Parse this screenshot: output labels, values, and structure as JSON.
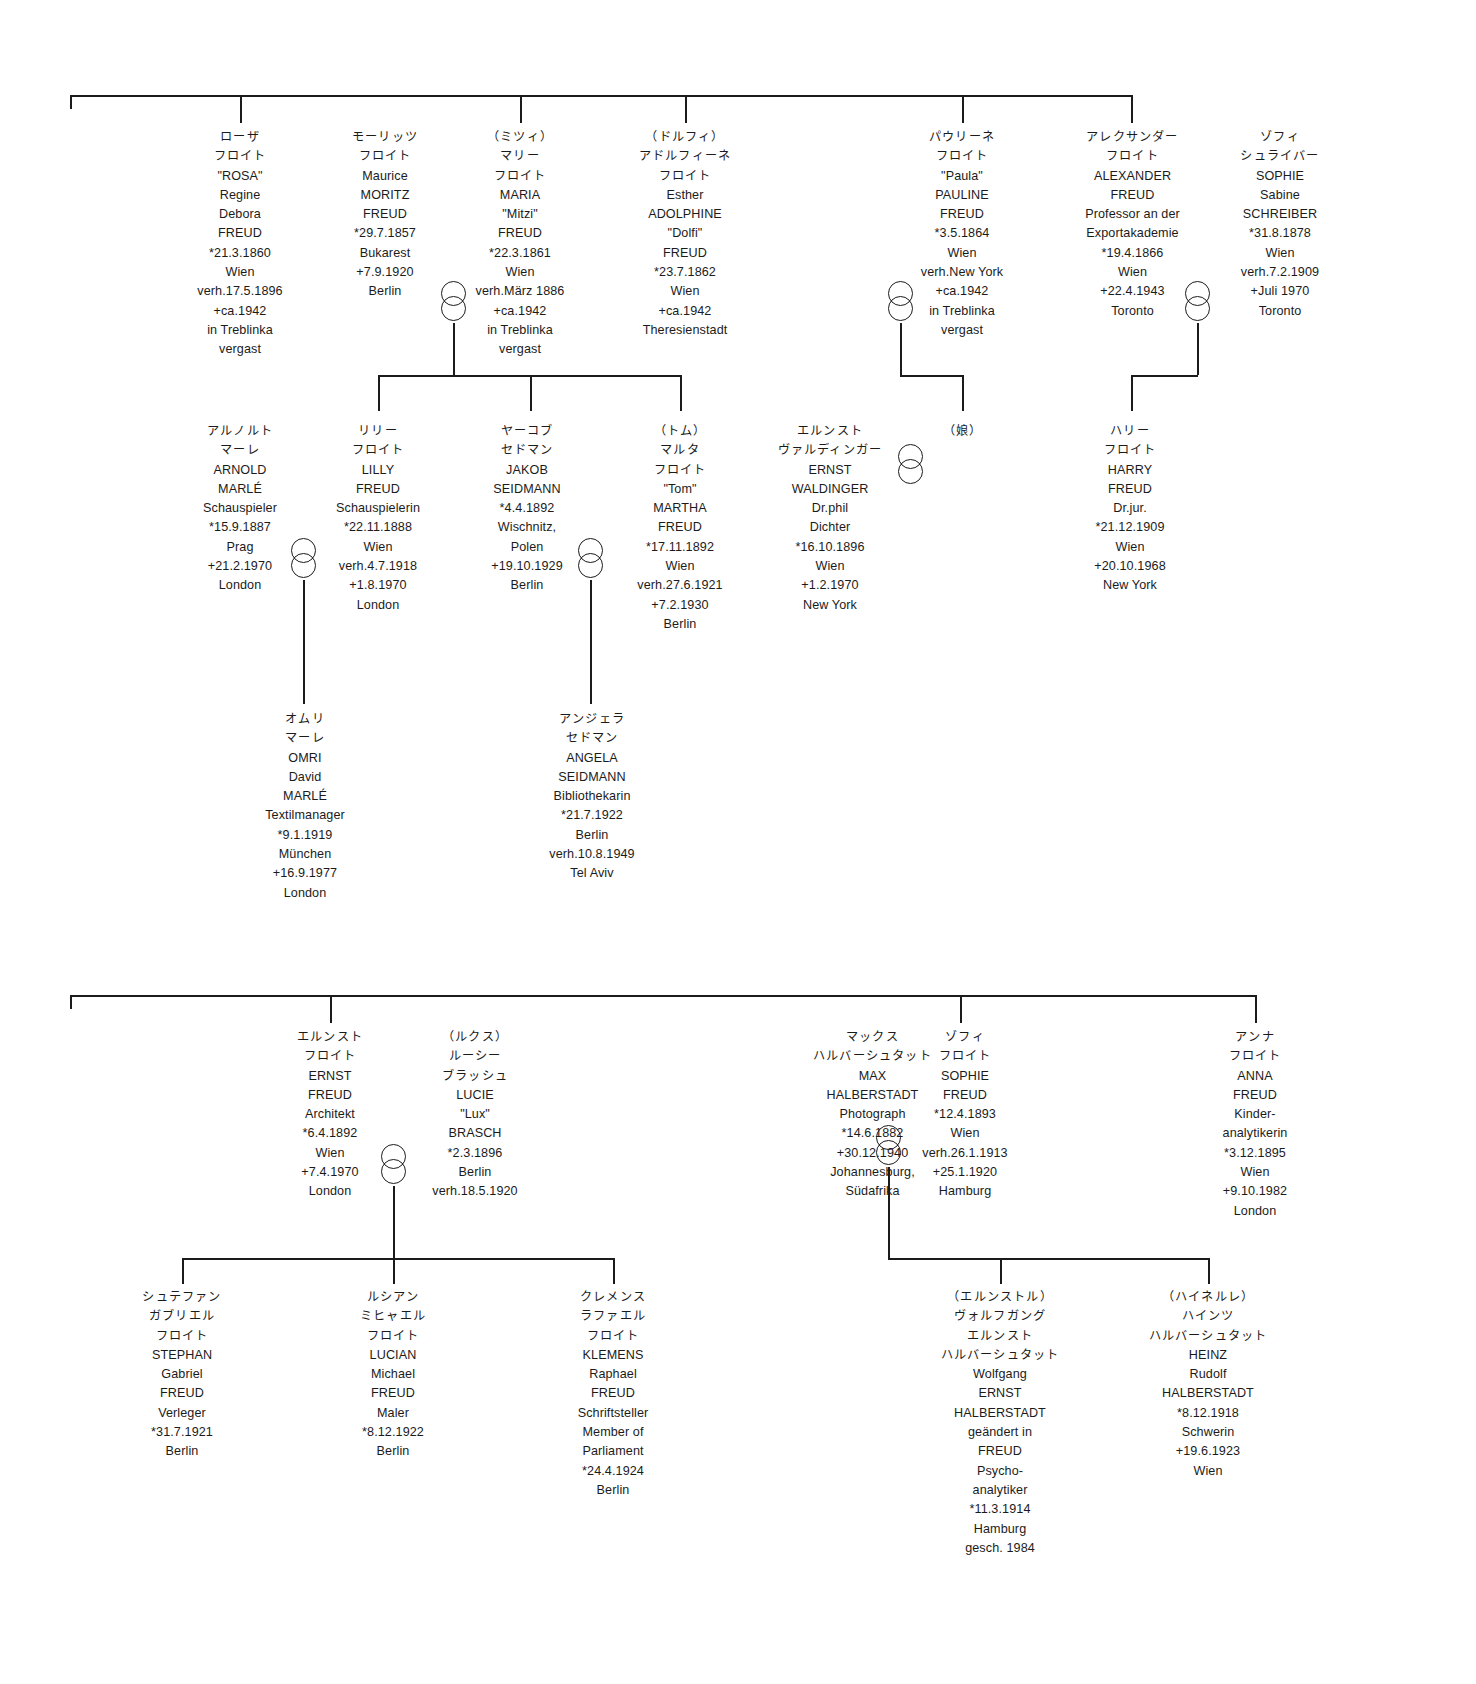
{
  "diagram": {
    "line_color": "#1b1b1b",
    "background": "#ffffff"
  },
  "people": [
    {
      "id": "rosa-freud",
      "name": "Rosa Freud",
      "lines": [
        "ローザ",
        "フロイト",
        "\"ROSA\"",
        "Regine",
        "Debora",
        "FREUD",
        "*21.3.1860",
        "Wien",
        "verh.17.5.1896",
        "+ca.1942",
        "in Treblinka",
        "vergast"
      ]
    },
    {
      "id": "moritz-freud",
      "name": "Moritz Freud",
      "lines": [
        "モーリッツ",
        "フロイト",
        "Maurice",
        "MORITZ",
        "FREUD",
        "*29.7.1857",
        "Bukarest",
        "+7.9.1920",
        "Berlin"
      ]
    },
    {
      "id": "maria-mitzi-freud",
      "name": "Maria Mitzi Freud",
      "lines": [
        "（ミツィ）",
        "マリー",
        "フロイト",
        "MARIA",
        "\"Mitzi\"",
        "FREUD",
        "*22.3.1861",
        "Wien",
        "verh.März 1886",
        "+ca.1942",
        "in Treblinka",
        "vergast"
      ]
    },
    {
      "id": "adolphine-dolfi-freud",
      "name": "Adolphine Dolfi Freud",
      "lines": [
        "（ドルフィ）",
        "アドルフィーネ",
        "フロイト",
        "Esther",
        "ADOLPHINE",
        "\"Dolfi\"",
        "FREUD",
        "*23.7.1862",
        "Wien",
        "+ca.1942",
        "Theresienstadt"
      ]
    },
    {
      "id": "pauline-freud",
      "name": "Pauline Freud",
      "lines": [
        "パウリーネ",
        "フロイト",
        "\"Paula\"",
        "PAULINE",
        "FREUD",
        "*3.5.1864",
        "Wien",
        "verh.New York",
        "+ca.1942",
        "in Treblinka",
        "vergast"
      ]
    },
    {
      "id": "alexander-freud",
      "name": "Alexander Freud",
      "lines": [
        "アレクサンダー",
        "フロイト",
        "ALEXANDER",
        "FREUD",
        "Professor an der",
        "Exportakademie",
        "*19.4.1866",
        "Wien",
        "+22.4.1943",
        "Toronto"
      ]
    },
    {
      "id": "sophie-schreiber",
      "name": "Sophie Schreiber",
      "lines": [
        "ゾフィ",
        "シュライバー",
        "SOPHIE",
        "Sabine",
        "SCHREIBER",
        "*31.8.1878",
        "Wien",
        "verh.7.2.1909",
        "+Juli 1970",
        "Toronto"
      ]
    },
    {
      "id": "arnold-marle",
      "name": "Arnold Marlé",
      "lines": [
        "アルノルト",
        "マーレ",
        "ARNOLD",
        "MARLÉ",
        "Schauspieler",
        "*15.9.1887",
        "Prag",
        "+21.2.1970",
        "London"
      ]
    },
    {
      "id": "lilly-freud",
      "name": "Lilly Freud",
      "lines": [
        "リリー",
        "フロイト",
        "LILLY",
        "FREUD",
        "Schauspielerin",
        "*22.11.1888",
        "Wien",
        "verh.4.7.1918",
        "+1.8.1970",
        "London"
      ]
    },
    {
      "id": "jakob-seidmann",
      "name": "Jakob Seidmann",
      "lines": [
        "ヤーコブ",
        "セドマン",
        "JAKOB",
        "SEIDMANN",
        "*4.4.1892",
        "Wischnitz,",
        "Polen",
        "+19.10.1929",
        "Berlin"
      ]
    },
    {
      "id": "martha-tom-freud",
      "name": "Martha Tom Freud",
      "lines": [
        "（トム）",
        "マルタ",
        "フロイト",
        "\"Tom\"",
        "MARTHA",
        "FREUD",
        "*17.11.1892",
        "Wien",
        "verh.27.6.1921",
        "+7.2.1930",
        "Berlin"
      ]
    },
    {
      "id": "ernst-waldinger",
      "name": "Ernst Waldinger",
      "lines": [
        "エルンスト",
        "ヴァルディンガー",
        "ERNST",
        "WALDINGER",
        "Dr.phil",
        "Dichter",
        "*16.10.1896",
        "Wien",
        "+1.2.1970",
        "New York"
      ]
    },
    {
      "id": "daughter",
      "name": "Daughter",
      "lines": [
        "（娘）"
      ]
    },
    {
      "id": "harry-freud",
      "name": "Harry Freud",
      "lines": [
        "ハリー",
        "フロイト",
        "HARRY",
        "FREUD",
        "Dr.jur.",
        "*21.12.1909",
        "Wien",
        "+20.10.1968",
        "New York"
      ]
    },
    {
      "id": "omri-marle",
      "name": "Omri David Marlé",
      "lines": [
        "オムリ",
        "マーレ",
        "OMRI",
        "David",
        "MARLÉ",
        "Textilmanager",
        "*9.1.1919",
        "München",
        "+16.9.1977",
        "London"
      ]
    },
    {
      "id": "angela-seidmann",
      "name": "Angela Seidmann",
      "lines": [
        "アンジェラ",
        "セドマン",
        "ANGELA",
        "SEIDMANN",
        "Bibliothekarin",
        "*21.7.1922",
        "Berlin",
        "verh.10.8.1949",
        "Tel Aviv"
      ]
    },
    {
      "id": "ernst-freud",
      "name": "Ernst Freud",
      "lines": [
        "エルンスト",
        "フロイト",
        "ERNST",
        "FREUD",
        "Architekt",
        "*6.4.1892",
        "Wien",
        "+7.4.1970",
        "London"
      ]
    },
    {
      "id": "lucie-brasch",
      "name": "Lucie Lux Brasch",
      "lines": [
        "（ルクス）",
        "ルーシー",
        "ブラッシュ",
        "LUCIE",
        "\"Lux\"",
        "BRASCH",
        "*2.3.1896",
        "Berlin",
        "verh.18.5.1920"
      ]
    },
    {
      "id": "max-halberstadt",
      "name": "Max Halberstadt",
      "lines": [
        "マックス",
        "ハルバーシュタット",
        "MAX",
        "HALBERSTADT",
        "Photograph",
        "*14.6.1882",
        "+30.12.1940",
        "Johannesburg,",
        "Südafrika"
      ]
    },
    {
      "id": "sophie-freud",
      "name": "Sophie Freud",
      "lines": [
        "ゾフィ",
        "フロイト",
        "SOPHIE",
        "FREUD",
        "*12.4.1893",
        "Wien",
        "verh.26.1.1913",
        "+25.1.1920",
        "Hamburg"
      ]
    },
    {
      "id": "anna-freud",
      "name": "Anna Freud",
      "lines": [
        "アンナ",
        "フロイト",
        "ANNA",
        "FREUD",
        "Kinder-",
        "analytikerin",
        "*3.12.1895",
        "Wien",
        "+9.10.1982",
        "London"
      ]
    },
    {
      "id": "stephan-gabriel-freud",
      "name": "Stephan Gabriel Freud",
      "lines": [
        "シュテファン",
        "ガブリエル",
        "フロイト",
        "STEPHAN",
        "Gabriel",
        "FREUD",
        "Verleger",
        "*31.7.1921",
        "Berlin"
      ]
    },
    {
      "id": "lucian-michael-freud",
      "name": "Lucian Michael Freud",
      "lines": [
        "ルシアン",
        "ミヒャエル",
        "フロイト",
        "LUCIAN",
        "Michael",
        "FREUD",
        "Maler",
        "*8.12.1922",
        "Berlin"
      ]
    },
    {
      "id": "klemens-raphael-freud",
      "name": "Klemens Raphael Freud",
      "lines": [
        "クレメンス",
        "ラファエル",
        "フロイト",
        "KLEMENS",
        "Raphael",
        "FREUD",
        "Schriftsteller",
        "Member of",
        "Parliament",
        "*24.4.1924",
        "Berlin"
      ]
    },
    {
      "id": "wolfgang-ernst-halberstadt",
      "name": "Wolfgang Ernst Halberstadt",
      "lines": [
        "（エルンストル）",
        "ヴォルフガング",
        "エルンスト",
        "ハルバーシュタット",
        "Wolfgang",
        "ERNST",
        "HALBERSTADT",
        "geändert in",
        "FREUD",
        "Psycho-",
        "analytiker",
        "*11.3.1914",
        "Hamburg",
        "gesch. 1984"
      ]
    },
    {
      "id": "heinz-rudolf-halberstadt",
      "name": "Heinz Rudolf Halberstadt",
      "lines": [
        "（ハイネルレ）",
        "ハインツ",
        "ハルバーシュタット",
        "HEINZ",
        "Rudolf",
        "HALBERSTADT",
        "*8.12.1918",
        "Schwerin",
        "+19.6.1923",
        "Wien"
      ]
    }
  ],
  "marriages": [
    {
      "id": "moritz-mitzi",
      "symbol": "interlocking-rings"
    },
    {
      "id": "pauline-spouse",
      "symbol": "interlocking-rings"
    },
    {
      "id": "alexander-sophie",
      "symbol": "interlocking-rings"
    },
    {
      "id": "arnold-lilly",
      "symbol": "interlocking-rings"
    },
    {
      "id": "jakob-martha",
      "symbol": "interlocking-rings"
    },
    {
      "id": "ernst-waldinger-daughter",
      "symbol": "interlocking-rings"
    },
    {
      "id": "ernst-lucie",
      "symbol": "interlocking-rings"
    },
    {
      "id": "max-sophie",
      "symbol": "interlocking-rings"
    }
  ]
}
